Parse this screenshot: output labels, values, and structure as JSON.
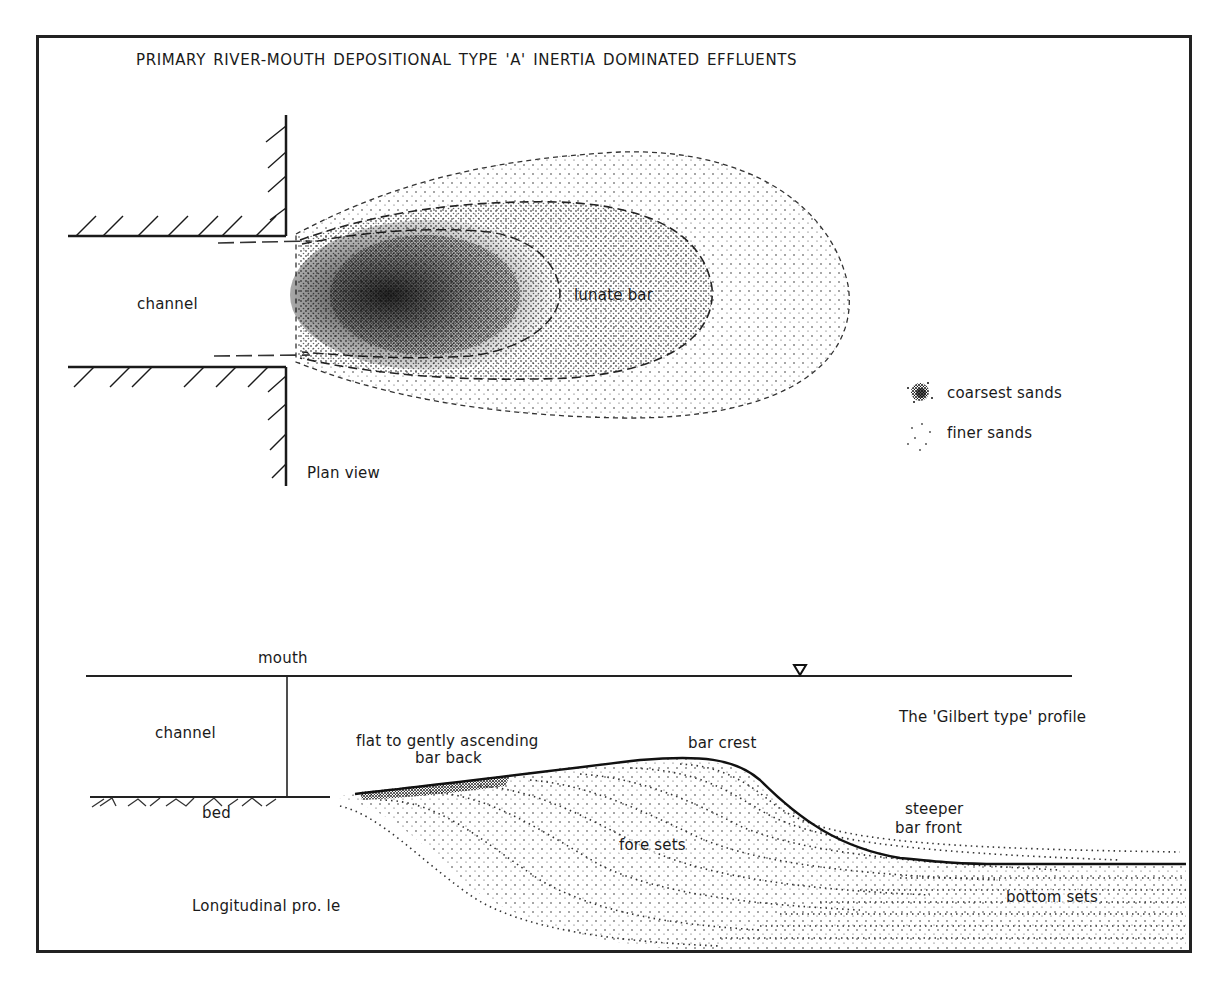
{
  "figure": {
    "title": "PRIMARY RIVER-MOUTH DEPOSITIONAL TYPE 'A'   INERTIA  DOMINATED EFFLUENTS"
  },
  "plan_view": {
    "caption": "Plan view",
    "channel_label": "channel",
    "bar_label": "lunate bar",
    "legend": {
      "items": [
        {
          "symbol": "dense-stipple",
          "label": "coarsest sands"
        },
        {
          "symbol": "sparse-stipple",
          "label": "finer sands"
        }
      ]
    }
  },
  "profile": {
    "caption": "Longitudinal pro. le",
    "mouth_label": "mouth",
    "channel_label": "channel",
    "bed_label": "bed",
    "profile_type": "The 'Gilbert type' profile",
    "bar_back_line1": "flat to gently ascending",
    "bar_back_line2": "bar back",
    "bar_crest_label": "bar crest",
    "bar_front_line1": "steeper",
    "bar_front_line2": "bar front",
    "fore_sets_label": "fore sets",
    "bottom_sets_label": "bottom sets",
    "water_level_symbol": "inverted-triangle"
  },
  "colors": {
    "ink": "#1a1a1a",
    "paper": "#ffffff"
  }
}
